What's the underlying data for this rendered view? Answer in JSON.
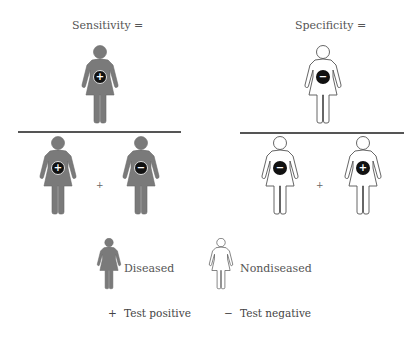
{
  "colors": {
    "diseased_fill": "#7a7a7a",
    "nondiseased_fill": "#ffffff",
    "outline": "#555555",
    "badge": "#111111",
    "divider": "#555555"
  },
  "sensitivity": {
    "title": "Sensitivity =",
    "numerator": [
      {
        "status": "diseased",
        "test": "+"
      }
    ],
    "denominator": [
      {
        "status": "diseased",
        "test": "+"
      },
      {
        "status": "diseased",
        "test": "−"
      }
    ],
    "operator": "+"
  },
  "specificity": {
    "title": "Specificity =",
    "numerator": [
      {
        "status": "nondiseased",
        "test": "−"
      }
    ],
    "denominator": [
      {
        "status": "nondiseased",
        "test": "−"
      },
      {
        "status": "nondiseased",
        "test": "+"
      }
    ],
    "operator": "+"
  },
  "legend": {
    "diseased_label": "Diseased",
    "nondiseased_label": "Nondiseased",
    "positive_symbol": "+",
    "positive_label": "Test positive",
    "negative_symbol": "−",
    "negative_label": "Test negative"
  }
}
